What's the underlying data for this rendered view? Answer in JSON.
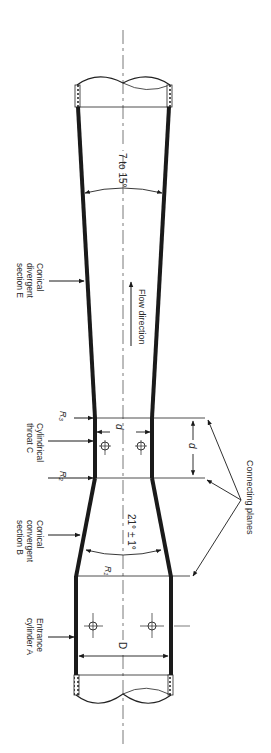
{
  "diagram": {
    "orientation": "rotated 90 degrees clockwise (text reads top-to-bottom)",
    "colors": {
      "wall": "#1a1a1a",
      "line": "#333333",
      "text": "#2a2a2a",
      "background": "#ffffff"
    },
    "labels": {
      "divergent_angle": "7 to 15°",
      "flow_direction": "Flow direction",
      "conical_divergent": [
        "Conical",
        "divergent",
        "section E"
      ],
      "cylindrical_throat": [
        "Cylindrical",
        "throat C"
      ],
      "conical_convergent": [
        "Conical",
        "convergent",
        "section B"
      ],
      "entrance_cylinder": [
        "Entrance",
        "cylinder A"
      ],
      "convergent_angle": "21° ± 1°",
      "connecting_planes": "Connecting planes",
      "r3": "R₃",
      "r2": "R₂",
      "r1": "R₁",
      "throat_diameter": "d",
      "throat_tap_spacing": "d",
      "inlet_diameter": "D"
    },
    "sections": [
      {
        "id": "A",
        "name": "Entrance cylinder",
        "shape": "cylindrical"
      },
      {
        "id": "B",
        "name": "Conical convergent section",
        "angle": "21° ± 1°"
      },
      {
        "id": "C",
        "name": "Cylindrical throat",
        "length": "d"
      },
      {
        "id": "E",
        "name": "Conical divergent section",
        "angle": "7 to 15°"
      }
    ],
    "pressure_taps": [
      {
        "location": "entrance cylinder A",
        "count": 2
      },
      {
        "location": "throat C",
        "count": 2
      }
    ]
  }
}
